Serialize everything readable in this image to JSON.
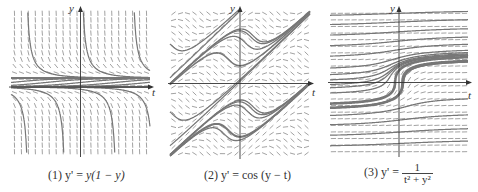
{
  "figure": {
    "panels": [
      {
        "id": 1,
        "caption_prefix": "(1) y' = ",
        "caption_expr": "y(1 − y)",
        "axis_x_label": "t",
        "axis_y_label": "y",
        "equilibria": [
          "y = 0",
          "y = 1"
        ]
      },
      {
        "id": 2,
        "caption_prefix": "(2) y' = ",
        "caption_expr": "cos (y − t)",
        "axis_x_label": "t",
        "axis_y_label": "y"
      },
      {
        "id": 3,
        "caption_prefix": "(3) y' = ",
        "caption_num": "1",
        "caption_den": "t² + y²",
        "axis_x_label": "t",
        "axis_y_label": "y"
      }
    ],
    "colors": {
      "curve": "#777777",
      "slope_mark": "#8a8a8a",
      "axis": "#333333"
    }
  }
}
